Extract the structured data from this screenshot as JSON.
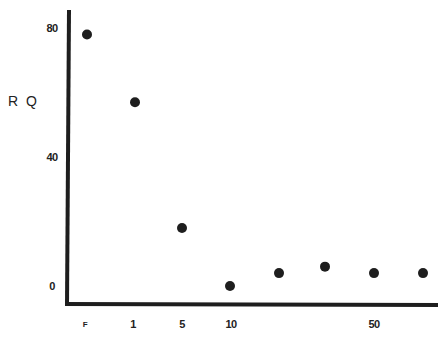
{
  "chart_data": {
    "type": "scatter",
    "title": "",
    "xlabel": "",
    "ylabel": "R Q",
    "x_tick_labels": [
      "F",
      "1",
      "5",
      "10",
      "50"
    ],
    "y_tick_labels": [
      "0",
      "40",
      "80"
    ],
    "ylim": [
      0,
      85
    ],
    "grid": false,
    "legend": null,
    "points": [
      {
        "x_label": "F",
        "y": 78
      },
      {
        "x_label": "1",
        "y": 57
      },
      {
        "x_label": "5",
        "y": 18
      },
      {
        "x_label": "10",
        "y": 0
      },
      {
        "x_label": "",
        "y": 4
      },
      {
        "x_label": "",
        "y": 6
      },
      {
        "x_label": "50",
        "y": 4
      },
      {
        "x_label": "",
        "y": 4
      }
    ],
    "point_x_px": [
      87,
      135,
      182,
      230,
      279,
      325,
      374,
      423
    ]
  },
  "axes": {
    "y_axis_label": "R Q",
    "y_ticks": [
      {
        "label": "80",
        "value": 80
      },
      {
        "label": "40",
        "value": 40
      },
      {
        "label": "0",
        "value": 0
      }
    ],
    "x_ticks": [
      {
        "label": "F",
        "px": 85,
        "small": true
      },
      {
        "label": "1",
        "px": 133
      },
      {
        "label": "5",
        "px": 182
      },
      {
        "label": "10",
        "px": 231
      },
      {
        "label": "50",
        "px": 374
      }
    ]
  },
  "colors": {
    "axis": "#1e1e1e",
    "point": "#1e1e1e",
    "background": "#ffffff"
  }
}
